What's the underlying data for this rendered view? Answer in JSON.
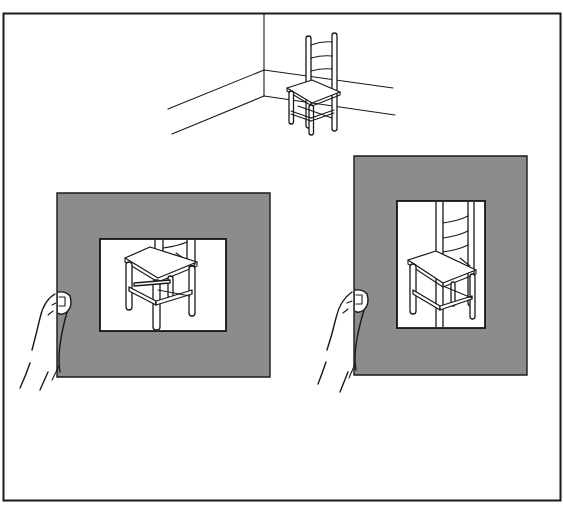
{
  "figure": {
    "frame_border_color": "#1a1a1a",
    "background": "#ffffff"
  },
  "scene": {
    "subject": "ladder-back chair",
    "setting": "room corner with baseboards"
  },
  "viewfinders": [
    {
      "name": "horizontal viewfinder",
      "orientation": "landscape",
      "mat_color": "#8c8c8c",
      "held_by": "left hand",
      "view": "chair seat, legs and stretchers cropped"
    },
    {
      "name": "vertical viewfinder",
      "orientation": "portrait",
      "mat_color": "#8c8c8c",
      "held_by": "left hand",
      "view": "chair with ladder back, cropped vertically"
    }
  ],
  "caption": ""
}
